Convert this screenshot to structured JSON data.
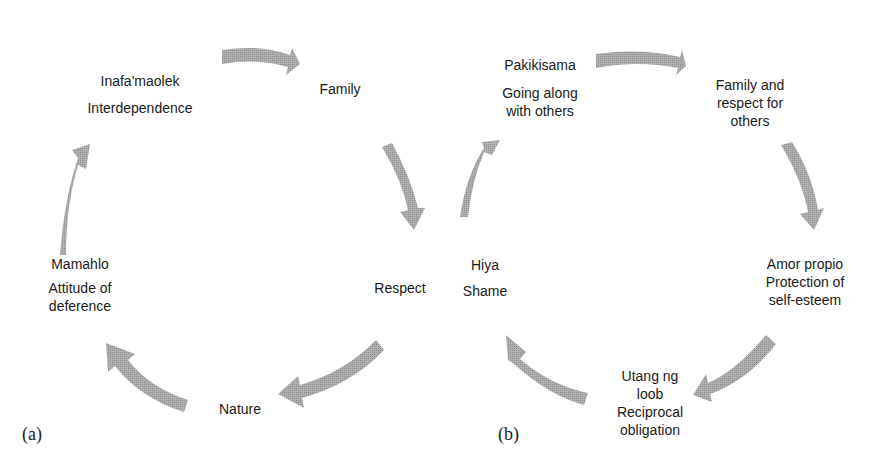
{
  "diagram_a": {
    "tag": "(a)",
    "nodes": [
      {
        "id": "inafamaolek",
        "lines": [
          "Inafa'maolek",
          "Interdependence"
        ]
      },
      {
        "id": "family",
        "lines": [
          "Family"
        ]
      },
      {
        "id": "respect",
        "lines": [
          "Respect"
        ]
      },
      {
        "id": "nature",
        "lines": [
          "Nature"
        ]
      },
      {
        "id": "mamahlo",
        "lines": [
          "Mamahlo",
          "Attitude of",
          "deference"
        ]
      }
    ]
  },
  "diagram_b": {
    "tag": "(b)",
    "nodes": [
      {
        "id": "pakikisama",
        "lines": [
          "Pakikisama",
          "Going along",
          "with others"
        ]
      },
      {
        "id": "family-respect",
        "lines": [
          "Family and",
          "respect for",
          "others"
        ]
      },
      {
        "id": "amor-propio",
        "lines": [
          "Amor propio",
          "Protection of",
          "self-esteem"
        ]
      },
      {
        "id": "utang-ng-loob",
        "lines": [
          "Utang ng",
          "loob",
          "Reciprocal",
          "obligation"
        ]
      },
      {
        "id": "hiya",
        "lines": [
          "Hiya",
          "Shame"
        ]
      }
    ]
  },
  "colors": {
    "arrow": "#a6a6a6",
    "text": "#1a1a1a"
  }
}
